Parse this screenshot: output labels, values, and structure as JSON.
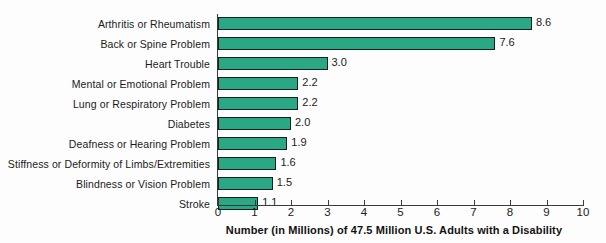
{
  "chart_data": {
    "type": "bar",
    "orientation": "horizontal",
    "title": "",
    "xlabel": "Number (in Millions) of 47.5 Million U.S. Adults with a Disability",
    "ylabel": "",
    "xlim": [
      0,
      10
    ],
    "xticks": [
      0,
      1,
      2,
      3,
      4,
      5,
      6,
      7,
      8,
      9,
      10
    ],
    "xtick_labels": [
      "0",
      "1",
      "2",
      "3",
      "4",
      "5",
      "6",
      "7",
      "8",
      "9",
      "10"
    ],
    "grid": false,
    "legend": false,
    "bar_color": "#2aa884",
    "bar_edge_color": "#17201e",
    "categories": [
      "Arthritis or Rheumatism",
      "Back or Spine Problem",
      "Heart Trouble",
      "Mental or Emotional Problem",
      "Lung or Respiratory Problem",
      "Diabetes",
      "Deafness or Hearing Problem",
      "Stiffness or Deformity of Limbs/Extremities",
      "Blindness or Vision Problem",
      "Stroke"
    ],
    "values": [
      8.6,
      7.6,
      3.0,
      2.2,
      2.2,
      2.0,
      1.9,
      1.6,
      1.5,
      1.1
    ],
    "value_labels": [
      "8.6",
      "7.6",
      "3.0",
      "2.2",
      "2.2",
      "2.0",
      "1.9",
      "1.6",
      "1.5",
      "1.1"
    ]
  }
}
